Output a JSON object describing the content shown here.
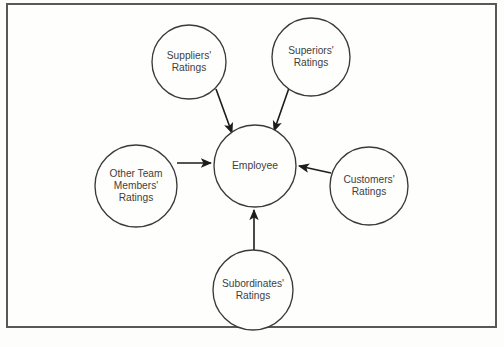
{
  "diagram": {
    "frame": {
      "border_color": "#58585a",
      "background_color": "#fefefc"
    },
    "style": {
      "circle_stroke": "#3a3a3c",
      "text_color": "#3f3f41",
      "arrow_color": "#1c1c1e"
    },
    "center_node": {
      "id": "employee",
      "label": "Employee",
      "lines": [
        "Employee"
      ],
      "cx": 255,
      "cy": 166,
      "r": 41
    },
    "source_nodes": [
      {
        "id": "suppliers",
        "label": "Suppliers' Ratings",
        "lines": [
          "Suppliers'",
          "Ratings"
        ],
        "cx": 189,
        "cy": 62,
        "r": 37,
        "position": "top-left"
      },
      {
        "id": "superiors",
        "label": "Superiors' Ratings",
        "lines": [
          "Superiors'",
          "Ratings"
        ],
        "cx": 311,
        "cy": 57,
        "r": 39,
        "position": "top-right"
      },
      {
        "id": "other-team-members",
        "label": "Other Team Members' Ratings",
        "lines": [
          "Other Team",
          "Members'",
          "Ratings"
        ],
        "cx": 136,
        "cy": 186,
        "r": 41,
        "position": "left"
      },
      {
        "id": "customers",
        "label": "Customers' Ratings",
        "lines": [
          "Customers'",
          "Ratings"
        ],
        "cx": 369,
        "cy": 186,
        "r": 39,
        "position": "right"
      },
      {
        "id": "subordinates",
        "label": "Subordinates' Ratings",
        "lines": [
          "Subordinates'",
          "Ratings"
        ],
        "cx": 253,
        "cy": 290,
        "r": 40,
        "position": "bottom"
      }
    ],
    "arrows": [
      {
        "id": "suppliers-to-employee",
        "from": "suppliers",
        "to": "employee",
        "x1": 216,
        "y1": 89,
        "x2": 232,
        "y2": 133
      },
      {
        "id": "superiors-to-employee",
        "from": "superiors",
        "to": "employee",
        "x1": 289,
        "y1": 88,
        "x2": 274,
        "y2": 131
      },
      {
        "id": "team-to-employee",
        "from": "other-team-members",
        "to": "employee",
        "x1": 177,
        "y1": 163,
        "x2": 211,
        "y2": 163
      },
      {
        "id": "customers-to-employee",
        "from": "customers",
        "to": "employee",
        "x1": 331,
        "y1": 173,
        "x2": 299,
        "y2": 166
      },
      {
        "id": "subordinates-to-employee",
        "from": "subordinates",
        "to": "employee",
        "x1": 254,
        "y1": 251,
        "x2": 254,
        "y2": 210
      }
    ]
  }
}
